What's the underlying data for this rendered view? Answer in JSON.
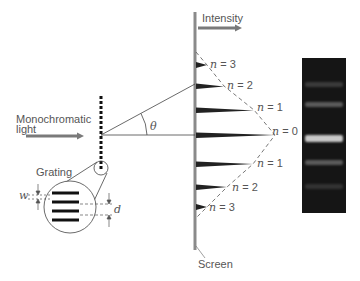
{
  "labels": {
    "intensity": "Intensity",
    "monochromatic_line1": "Monochromatic",
    "monochromatic_line2": "light",
    "grating": "Grating",
    "screen": "Screen",
    "theta": "θ",
    "w": "w",
    "d": "d"
  },
  "orders": [
    {
      "n_symbol": "n",
      "eq": " = 3",
      "order": 3,
      "side": "upper"
    },
    {
      "n_symbol": "n",
      "eq": " = 2",
      "order": 2,
      "side": "upper"
    },
    {
      "n_symbol": "n",
      "eq": " = 1",
      "order": 1,
      "side": "upper"
    },
    {
      "n_symbol": "n",
      "eq": " = 0",
      "order": 0,
      "side": "center"
    },
    {
      "n_symbol": "n",
      "eq": " = 1",
      "order": 1,
      "side": "lower"
    },
    {
      "n_symbol": "n",
      "eq": " = 2",
      "order": 2,
      "side": "lower"
    },
    {
      "n_symbol": "n",
      "eq": " = 3",
      "order": 3,
      "side": "lower"
    }
  ],
  "colors": {
    "screen": "#8a8a8a",
    "arrow": "#7a7a7a",
    "ink": "#333333",
    "spectrum_bg": "#151515"
  }
}
